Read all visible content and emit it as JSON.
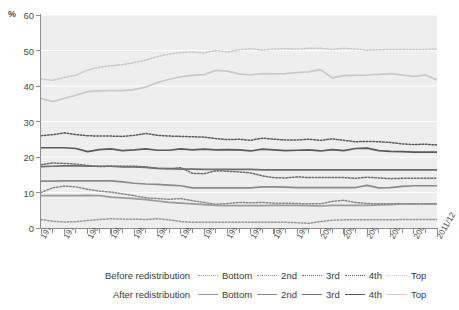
{
  "axes": {
    "y_unit": "%",
    "y_ticks": [
      0,
      10,
      20,
      30,
      40,
      50,
      60
    ],
    "y_min": 0,
    "y_max": 60,
    "x_ticks": [
      "1977/78",
      "1979/80",
      "1981/82",
      "1983/84",
      "1985/86",
      "1987/88",
      "1989/90",
      "1991/92",
      "1993/94",
      "1995/96",
      "1997/98",
      "1999/00",
      "2001/02",
      "2003/04",
      "2005/06",
      "2007/08",
      "2009/10",
      "2011/12"
    ]
  },
  "legend": {
    "row_before_label": "Before redistribution",
    "row_after_label": "After redistribution",
    "entries": [
      "Bottom",
      "2nd",
      "3rd",
      "4th",
      "Top"
    ],
    "before_style": "dotted",
    "after_style": "solid"
  },
  "colors": {
    "plot_background": "#eeeeee",
    "gridline": "#ffffff",
    "axis": "#8d8d8d",
    "bottom": "#9a9a9a",
    "second": "#8a8a8a",
    "third": "#6e6e6e",
    "fourth": "#5a5a5a",
    "top": "#c9c9c9",
    "text": "#3a3a3a"
  },
  "chart_data": {
    "type": "line",
    "title": "",
    "subtitle": "",
    "xlabel": "",
    "ylabel": "%",
    "ylim": [
      0,
      60
    ],
    "xlim": [
      "1977/78",
      "2011/12"
    ],
    "grid": true,
    "legend_position": "bottom",
    "x": [
      "1977/78",
      "1978/79",
      "1979/80",
      "1980/81",
      "1981/82",
      "1982/83",
      "1983/84",
      "1984/85",
      "1985/86",
      "1986/87",
      "1987/88",
      "1988/89",
      "1989/90",
      "1990/91",
      "1991/92",
      "1992/93",
      "1993/94",
      "1994/95",
      "1995/96",
      "1996/97",
      "1997/98",
      "1998/99",
      "1999/00",
      "2000/01",
      "2001/02",
      "2002/03",
      "2003/04",
      "2004/05",
      "2005/06",
      "2006/07",
      "2007/08",
      "2008/09",
      "2009/10",
      "2010/11",
      "2011/12"
    ],
    "series": [
      {
        "name": "Before redistribution - Top",
        "group": "before",
        "quintile": "Top",
        "style": "dotted",
        "color": "#c9c9c9",
        "values": [
          42.0,
          41.6,
          42.4,
          43.0,
          44.5,
          45.3,
          45.7,
          46.0,
          46.6,
          47.3,
          48.3,
          49.0,
          49.4,
          49.6,
          49.3,
          50.0,
          49.6,
          50.2,
          50.5,
          50.1,
          50.4,
          50.5,
          50.4,
          50.6,
          50.6,
          50.3,
          50.6,
          50.4,
          50.1,
          50.2,
          50.3,
          50.3,
          50.3,
          50.3,
          50.4
        ]
      },
      {
        "name": "After redistribution - Top",
        "group": "after",
        "quintile": "Top",
        "style": "solid",
        "color": "#c9c9c9",
        "values": [
          36.5,
          35.6,
          36.5,
          37.4,
          38.4,
          38.6,
          38.7,
          38.7,
          39.0,
          39.7,
          41.0,
          41.9,
          42.6,
          43.0,
          43.2,
          44.4,
          44.2,
          43.4,
          43.1,
          43.5,
          43.4,
          43.5,
          43.8,
          44.0,
          44.6,
          42.3,
          42.9,
          43.0,
          43.1,
          43.3,
          43.5,
          43.1,
          42.7,
          43.1,
          41.7
        ]
      },
      {
        "name": "Before redistribution - 4th",
        "group": "before",
        "quintile": "4th",
        "style": "dotted",
        "color": "#5a5a5a",
        "values": [
          26.0,
          26.3,
          26.8,
          26.3,
          26.0,
          25.9,
          25.9,
          25.8,
          26.1,
          26.6,
          26.1,
          25.9,
          25.8,
          25.7,
          25.6,
          25.2,
          24.9,
          25.0,
          24.7,
          25.3,
          25.0,
          24.8,
          24.8,
          25.0,
          24.7,
          25.1,
          24.7,
          24.3,
          24.4,
          24.3,
          24.1,
          23.7,
          23.5,
          23.6,
          23.4
        ]
      },
      {
        "name": "After redistribution - 4th",
        "group": "after",
        "quintile": "4th",
        "style": "solid",
        "color": "#5a5a5a",
        "values": [
          22.6,
          22.6,
          22.6,
          22.4,
          21.5,
          22.1,
          22.3,
          21.8,
          22.0,
          22.3,
          21.9,
          21.9,
          22.3,
          22.0,
          22.2,
          22.0,
          22.1,
          22.0,
          21.7,
          22.2,
          22.0,
          21.8,
          21.9,
          22.0,
          21.7,
          22.1,
          21.8,
          22.4,
          22.5,
          21.8,
          21.6,
          21.5,
          21.4,
          21.4,
          21.4
        ]
      },
      {
        "name": "Before redistribution - 3rd",
        "group": "before",
        "quintile": "3rd",
        "style": "dotted",
        "color": "#6e6e6e",
        "values": [
          17.8,
          18.3,
          18.2,
          18.0,
          17.6,
          17.3,
          17.4,
          17.4,
          17.4,
          17.2,
          16.8,
          16.7,
          17.0,
          15.4,
          15.3,
          16.1,
          16.0,
          15.8,
          15.5,
          14.7,
          14.2,
          14.1,
          14.4,
          14.2,
          14.2,
          14.2,
          14.2,
          14.0,
          14.3,
          14.1,
          13.9,
          14.0,
          14.0,
          14.0,
          14.0
        ]
      },
      {
        "name": "After redistribution - 3rd",
        "group": "after",
        "quintile": "3rd",
        "style": "solid",
        "color": "#6e6e6e",
        "values": [
          17.3,
          17.4,
          17.5,
          17.5,
          17.4,
          17.4,
          17.4,
          17.2,
          17.2,
          17.1,
          16.8,
          16.7,
          16.6,
          16.6,
          16.5,
          16.5,
          16.5,
          16.5,
          16.5,
          16.4,
          16.4,
          16.4,
          16.4,
          16.4,
          16.4,
          16.4,
          16.4,
          16.4,
          16.4,
          16.4,
          16.4,
          16.4,
          16.4,
          16.4,
          16.4
        ]
      },
      {
        "name": "Before redistribution - 2nd",
        "group": "before",
        "quintile": "2nd",
        "style": "dotted",
        "color": "#8a8a8a",
        "values": [
          10.0,
          11.3,
          11.8,
          11.6,
          10.9,
          10.4,
          10.1,
          9.6,
          9.1,
          8.5,
          8.3,
          8.1,
          8.3,
          7.7,
          7.2,
          6.7,
          6.9,
          7.2,
          7.1,
          7.2,
          7.0,
          7.0,
          6.9,
          6.8,
          6.8,
          7.5,
          7.8,
          7.2,
          6.9,
          6.8,
          6.8,
          6.8,
          6.8,
          6.8,
          6.8
        ]
      },
      {
        "name": "After redistribution - 2nd",
        "group": "after",
        "quintile": "2nd",
        "style": "solid",
        "color": "#8a8a8a",
        "values": [
          13.2,
          13.2,
          13.3,
          13.3,
          13.3,
          13.3,
          13.3,
          13.0,
          12.6,
          12.4,
          12.3,
          12.1,
          11.9,
          11.3,
          11.3,
          11.3,
          11.3,
          11.3,
          11.3,
          11.6,
          11.6,
          11.5,
          11.4,
          11.4,
          11.4,
          11.4,
          11.4,
          11.4,
          12.0,
          11.3,
          11.4,
          11.7,
          11.9,
          11.9,
          11.9
        ]
      },
      {
        "name": "Before redistribution - Bottom",
        "group": "before",
        "quintile": "Bottom",
        "style": "dotted",
        "color": "#9a9a9a",
        "values": [
          2.4,
          1.9,
          1.7,
          1.8,
          2.1,
          2.4,
          2.6,
          2.5,
          2.5,
          2.4,
          2.6,
          2.3,
          1.8,
          1.6,
          1.6,
          1.6,
          1.6,
          1.6,
          1.6,
          1.6,
          1.6,
          1.6,
          1.5,
          1.3,
          1.8,
          2.2,
          2.3,
          2.3,
          2.3,
          2.3,
          2.3,
          2.4,
          2.4,
          2.4,
          2.4
        ]
      },
      {
        "name": "After redistribution - Bottom",
        "group": "after",
        "quintile": "Bottom",
        "style": "solid",
        "color": "#9a9a9a",
        "values": [
          9.1,
          9.1,
          9.1,
          9.1,
          9.2,
          9.1,
          8.7,
          8.5,
          8.3,
          8.0,
          7.6,
          7.2,
          7.0,
          6.8,
          6.6,
          6.4,
          6.3,
          6.3,
          6.3,
          6.3,
          6.4,
          6.4,
          6.4,
          6.3,
          6.2,
          6.4,
          6.4,
          6.4,
          6.4,
          6.5,
          6.6,
          6.8,
          6.8,
          6.8,
          6.8
        ]
      }
    ]
  }
}
